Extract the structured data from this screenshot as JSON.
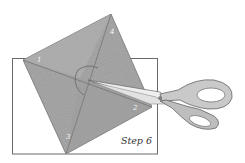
{
  "illustration": {
    "caption": "Step 6",
    "corner_labels": {
      "left": "1",
      "right": "2",
      "bottom": "3",
      "top": "4"
    },
    "colors": {
      "paper_fill": "#a9a9a9",
      "paper_light": "#c2c2c2",
      "outline": "#555555",
      "frame": "#6a6a6a",
      "scissors_fill": "#c9c9c9",
      "scissors_blade": "#efefef",
      "background": "#ffffff"
    }
  }
}
